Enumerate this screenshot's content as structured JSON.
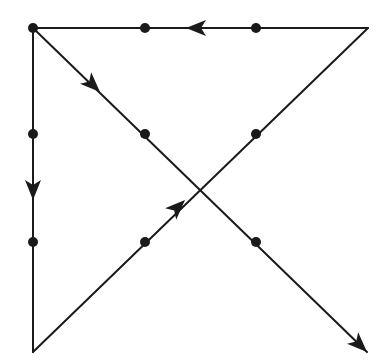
{
  "diagram": {
    "title": "",
    "type": "nine-dot-puzzle-solution",
    "canvas": {
      "width": 389,
      "height": 362
    },
    "colors": {
      "stroke": "#1a1a1a",
      "background": "#ffffff"
    },
    "grid": {
      "columns_x": [
        33,
        145,
        256
      ],
      "rows_y": [
        28,
        134,
        242
      ],
      "dot_radius": 5
    },
    "dots": [
      {
        "id": "r1c1",
        "x": 33,
        "y": 28
      },
      {
        "id": "r1c2",
        "x": 145,
        "y": 28
      },
      {
        "id": "r1c3",
        "x": 256,
        "y": 28
      },
      {
        "id": "r2c1",
        "x": 33,
        "y": 134
      },
      {
        "id": "r2c2",
        "x": 145,
        "y": 134
      },
      {
        "id": "r2c3",
        "x": 256,
        "y": 134
      },
      {
        "id": "r3c1",
        "x": 33,
        "y": 242
      },
      {
        "id": "r3c2",
        "x": 145,
        "y": 242
      },
      {
        "id": "r3c3",
        "x": 256,
        "y": 242
      }
    ],
    "path_vertices": [
      {
        "label": "start",
        "x": 33,
        "y": 28
      },
      {
        "label": "bottom-left corner",
        "x": 33,
        "y": 352
      },
      {
        "label": "top-right corner",
        "x": 368,
        "y": 28
      },
      {
        "label": "back to start",
        "x": 33,
        "y": 28
      },
      {
        "label": "end (arrow tip)",
        "x": 367,
        "y": 352
      }
    ],
    "segments": [
      {
        "id": "seg-1-down",
        "from": [
          33,
          28
        ],
        "to": [
          33,
          352
        ],
        "direction": "down"
      },
      {
        "id": "seg-2-up-right",
        "from": [
          33,
          352
        ],
        "to": [
          368,
          28
        ],
        "direction": "up-right"
      },
      {
        "id": "seg-3-left",
        "from": [
          368,
          28
        ],
        "to": [
          33,
          28
        ],
        "direction": "left"
      },
      {
        "id": "seg-4-down-right",
        "from": [
          33,
          28
        ],
        "to": [
          367,
          352
        ],
        "direction": "down-right"
      }
    ],
    "arrows": [
      {
        "id": "arrow-down",
        "tip": [
          33,
          200
        ],
        "angle_deg": 90
      },
      {
        "id": "arrow-up-right",
        "tip": [
          185,
          200
        ],
        "angle_deg": -44
      },
      {
        "id": "arrow-left",
        "tip": [
          186,
          28
        ],
        "angle_deg": 180
      },
      {
        "id": "arrow-down-right-1",
        "tip": [
          100,
          92
        ],
        "angle_deg": 44
      },
      {
        "id": "arrow-down-right-2",
        "tip": [
          367,
          352
        ],
        "angle_deg": 44
      }
    ]
  }
}
